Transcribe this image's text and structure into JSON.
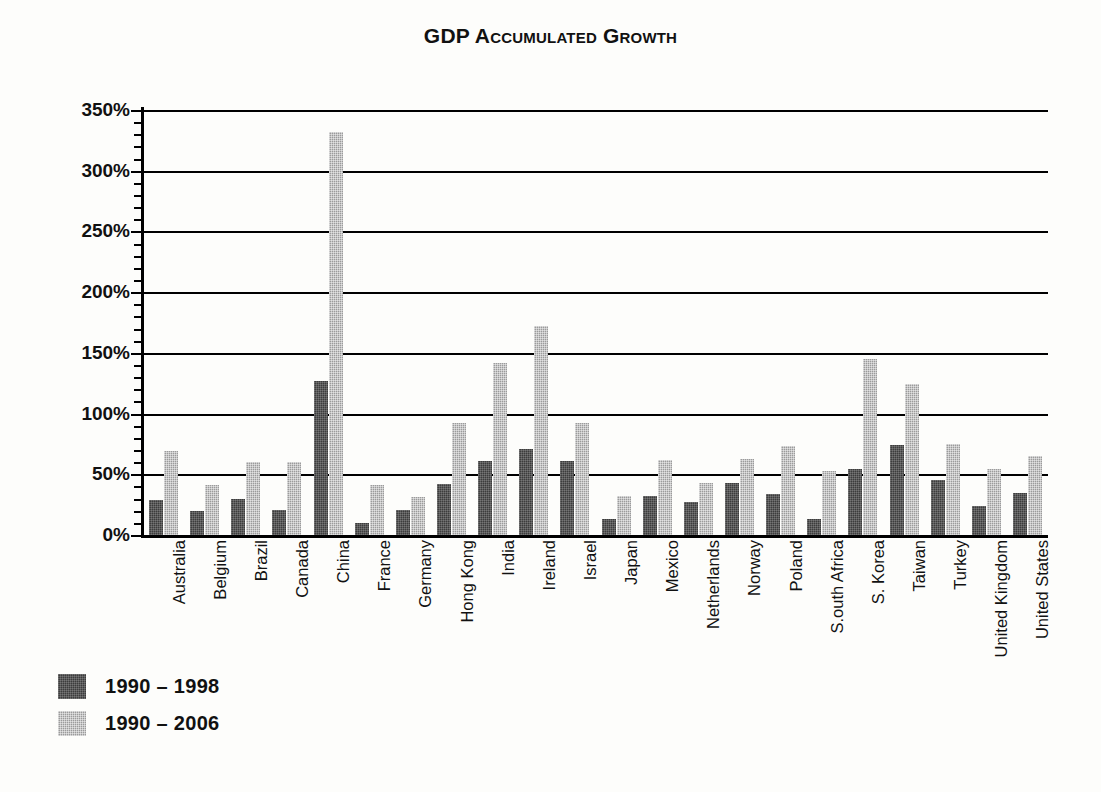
{
  "chart_data": {
    "type": "bar",
    "title": "GDP Accumulated Growth",
    "xlabel": "",
    "ylabel": "",
    "ylim": [
      0,
      350
    ],
    "ytick_values": [
      0,
      50,
      100,
      150,
      200,
      250,
      300,
      350
    ],
    "ytick_labels": [
      "0%",
      "50%",
      "100%",
      "150%",
      "200%",
      "250%",
      "300%",
      "350%"
    ],
    "minor_tick_step": 10,
    "grid": true,
    "legend_position": "bottom-left",
    "categories": [
      "Australia",
      "Belgium",
      "Brazil",
      "Canada",
      "China",
      "France",
      "Germany",
      "Hong Kong",
      "India",
      "Ireland",
      "Israel",
      "Japan",
      "Mexico",
      "Netherlands",
      "Norway",
      "Poland",
      "S.outh Africa",
      "S. Korea",
      "Taiwan",
      "Turkey",
      "United Kingdom",
      "United States"
    ],
    "series": [
      {
        "name": "1990 – 1998",
        "color": "#3c3c3c",
        "values": [
          29,
          20,
          30,
          21,
          127,
          10,
          21,
          42,
          61,
          71,
          61,
          13,
          32,
          27,
          43,
          34,
          13,
          54,
          74,
          45,
          24,
          35
        ]
      },
      {
        "name": "1990 – 2006",
        "color": "#9b9b9b",
        "values": [
          69,
          41,
          60,
          60,
          332,
          41,
          31,
          92,
          142,
          172,
          92,
          32,
          62,
          43,
          63,
          73,
          53,
          145,
          124,
          75,
          54,
          65
        ]
      }
    ]
  },
  "legend": {
    "items": [
      {
        "label": "1990 – 1998",
        "swatch": "s0"
      },
      {
        "label": "1990 – 2006",
        "swatch": "s1"
      }
    ]
  }
}
